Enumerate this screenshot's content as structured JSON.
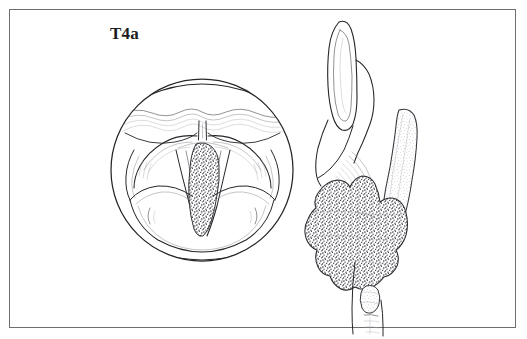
{
  "figure": {
    "stage_label": "T4a",
    "background_color": "#ffffff",
    "border_color": "#6e6e70",
    "line_color": "#26262a",
    "tumor_fill_color": "#5a5a5e"
  },
  "panels": {
    "endoscopic": {
      "name": "laryngoscopic-view",
      "shape": "circle",
      "center_x": 202,
      "center_y": 170,
      "radius": 92,
      "structures": [
        "epiglottis",
        "petiole",
        "false-vocal-cord-left",
        "false-vocal-cord-right",
        "true-vocal-cord-left",
        "true-vocal-cord-right",
        "aryepiglottic-fold-left",
        "aryepiglottic-fold-right",
        "arytenoid-left",
        "arytenoid-right",
        "posterior-commissure",
        "glottic-tumor"
      ]
    },
    "sagittal": {
      "name": "sagittal-section-view",
      "structures": [
        "epiglottis",
        "pre-epiglottic-space",
        "thyroid-cartilage",
        "vocal-ligament",
        "invading-tumor",
        "cricoid-cartilage",
        "trachea"
      ]
    }
  },
  "legend": {
    "tumor_texture": "stipple",
    "cartilage_texture": "fine-stipple"
  }
}
